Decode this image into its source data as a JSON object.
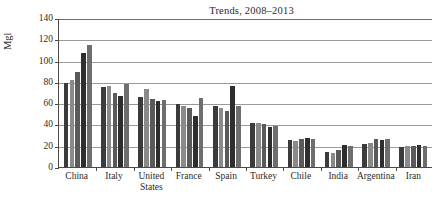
{
  "chart_data": {
    "type": "bar",
    "title": "Trends, 2008–2013",
    "xlabel": "",
    "ylabel": "Mgl",
    "ylim": [
      0,
      140
    ],
    "yticks": [
      0,
      20,
      40,
      60,
      80,
      100,
      120,
      140
    ],
    "grid": true,
    "legend": "none",
    "categories": [
      "China",
      "Italy",
      "United States",
      "France",
      "Spain",
      "Turkey",
      "Chile",
      "India",
      "Argentina",
      "Iran"
    ],
    "category_lines": [
      [
        "China"
      ],
      [
        "Italy"
      ],
      [
        "United",
        "States"
      ],
      [
        "France"
      ],
      [
        "Spain"
      ],
      [
        "Turkey"
      ],
      [
        "Chile"
      ],
      [
        "India"
      ],
      [
        "Argentina"
      ],
      [
        "Iran"
      ]
    ],
    "series": [
      {
        "name": "2008",
        "color": "#3b3b3b",
        "values": [
          79,
          75,
          66,
          59,
          57,
          41,
          25,
          14,
          22,
          19
        ]
      },
      {
        "name": "2009",
        "color": "#8a8a8a",
        "values": [
          82,
          76,
          73,
          57,
          55,
          41,
          24,
          13,
          23,
          20
        ]
      },
      {
        "name": "2010",
        "color": "#5a5a5a",
        "values": [
          89,
          70,
          64,
          55,
          53,
          40,
          26,
          16,
          26,
          20
        ]
      },
      {
        "name": "2011",
        "color": "#2e2e2e",
        "values": [
          107,
          67,
          62,
          48,
          76,
          38,
          27,
          21,
          25,
          21
        ]
      },
      {
        "name": "2012",
        "color": "#6e6e6e",
        "values": [
          115,
          78,
          63,
          65,
          57,
          39,
          26,
          20,
          26,
          20
        ]
      }
    ],
    "bar_colors": [
      "#3b3b3b",
      "#8a8a8a",
      "#5a5a5a",
      "#2e2e2e",
      "#6e6e6e"
    ]
  }
}
